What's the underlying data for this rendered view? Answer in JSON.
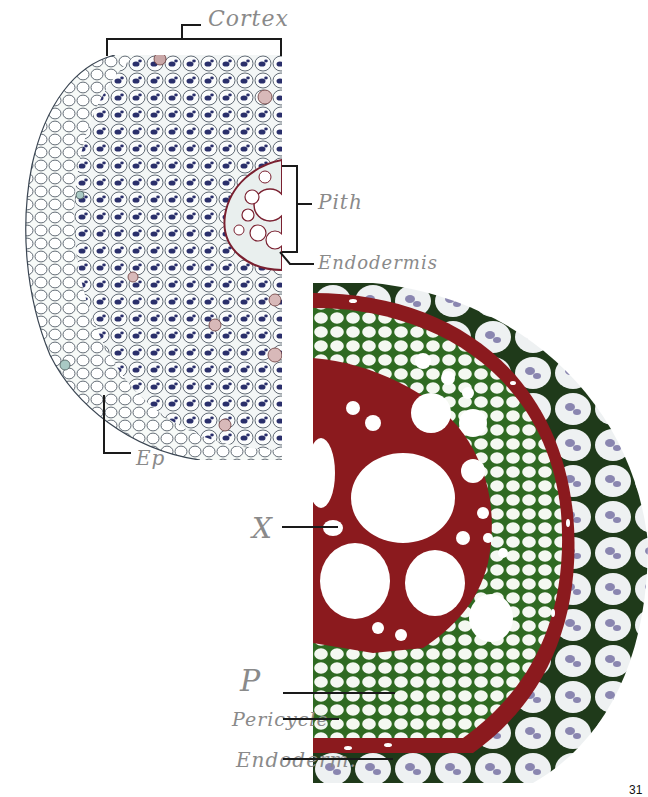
{
  "page": {
    "page_number": "31"
  },
  "micrograph_top_left": {
    "description": "Cross-section of monocot root (low magnification), stained",
    "labels": {
      "cortex": "Cortex",
      "pith": "Pith",
      "endodermis": "Endodermis",
      "epidermis": "Ep"
    }
  },
  "micrograph_bottom_right": {
    "description": "Vascular cylinder of root, high magnification",
    "labels": {
      "xylem": "X",
      "phloem": "P",
      "pericycle": "Pericycle",
      "endodermis": "Endoderm."
    }
  },
  "colors": {
    "cortex_cell_wall": "#2f3a4a",
    "starch_grains": "#2a2f6b",
    "xylem_wall": "#8b1a1e",
    "phloem_wall": "#3f7a2a",
    "endodermis_nuclei": "#8a86b0",
    "handwriting": "#8a8a8a",
    "leader_line": "#1a1a1a"
  }
}
